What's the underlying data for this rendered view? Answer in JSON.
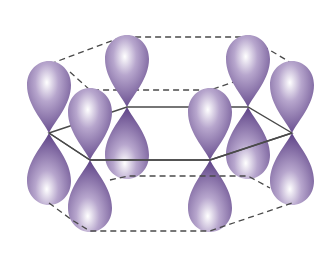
{
  "diagram": {
    "title": "p-orbitals of benzene ring",
    "colors": {
      "lobe_dark": "#6a4f8f",
      "lobe_mid": "#9a84b8",
      "lobe_light": "#ffffff",
      "bond_line": "#4a4a4a",
      "dashed_line": "#4a4a4a",
      "background": "#ffffff"
    },
    "nodes": [
      {
        "id": "left",
        "x": 49,
        "y": 133
      },
      {
        "id": "back-left",
        "x": 127,
        "y": 107
      },
      {
        "id": "back-right",
        "x": 248,
        "y": 107
      },
      {
        "id": "right",
        "x": 292,
        "y": 133
      },
      {
        "id": "front-right",
        "x": 210,
        "y": 160
      },
      {
        "id": "front-left",
        "x": 90,
        "y": 160
      }
    ],
    "top_dashed_hexagon": [
      [
        50,
        64
      ],
      [
        122,
        37
      ],
      [
        248,
        37
      ],
      [
        293,
        64
      ],
      [
        210,
        90
      ],
      [
        90,
        90
      ]
    ],
    "bottom_dashed_hexagon": [
      [
        49,
        203
      ],
      [
        120,
        176
      ],
      [
        248,
        176
      ],
      [
        292,
        203
      ],
      [
        210,
        231
      ],
      [
        90,
        231
      ]
    ]
  }
}
